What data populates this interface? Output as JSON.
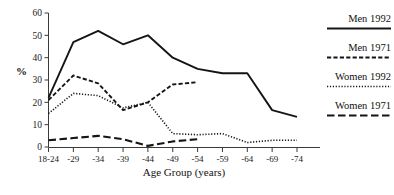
{
  "chart_data": {
    "type": "line",
    "title": "",
    "xlabel": "Age Group (years)",
    "ylabel": "%",
    "categories": [
      "18-24",
      "-29",
      "-34",
      "-39",
      "-44",
      "-49",
      "-54",
      "-59",
      "-64",
      "-69",
      "-74"
    ],
    "ylim": [
      0,
      60
    ],
    "yticks": [
      0,
      10,
      20,
      30,
      40,
      50,
      60
    ],
    "grid": false,
    "legend_position": "right",
    "series": [
      {
        "name": "Men 1992",
        "style": "solid",
        "color": "#151515",
        "x": [
          "18-24",
          "-29",
          "-34",
          "-39",
          "-44",
          "-49",
          "-54",
          "-59",
          "-64",
          "-69",
          "-74"
        ],
        "values": [
          22,
          47,
          52,
          46,
          50,
          40,
          35,
          33,
          33,
          16.5,
          13.5
        ]
      },
      {
        "name": "Men 1971",
        "style": "dashed-short",
        "color": "#151515",
        "x": [
          "18-24",
          "-29",
          "-34",
          "-39",
          "-44",
          "-49",
          "-54"
        ],
        "values": [
          21,
          32,
          28.5,
          16.5,
          20,
          28,
          29
        ]
      },
      {
        "name": "Women 1992",
        "style": "dotted",
        "color": "#151515",
        "x": [
          "18-24",
          "-29",
          "-34",
          "-39",
          "-44",
          "-49",
          "-54",
          "-59",
          "-64",
          "-69",
          "-74"
        ],
        "values": [
          15,
          24,
          23,
          17.5,
          20,
          6,
          5.5,
          6,
          2,
          3,
          3
        ]
      },
      {
        "name": "Women 1971",
        "style": "dashed-long",
        "color": "#151515",
        "x": [
          "18-24",
          "-29",
          "-34",
          "-39",
          "-44",
          "-49",
          "-54"
        ],
        "values": [
          3,
          4,
          5,
          3.5,
          0.5,
          2.5,
          3.5
        ]
      }
    ]
  },
  "legend": {
    "items": [
      {
        "label": "Men 1992",
        "style": "solid"
      },
      {
        "label": "Men 1971",
        "style": "dashed-short"
      },
      {
        "label": "Women 1992",
        "style": "dotted"
      },
      {
        "label": "Women 1971",
        "style": "dashed-long"
      }
    ]
  }
}
